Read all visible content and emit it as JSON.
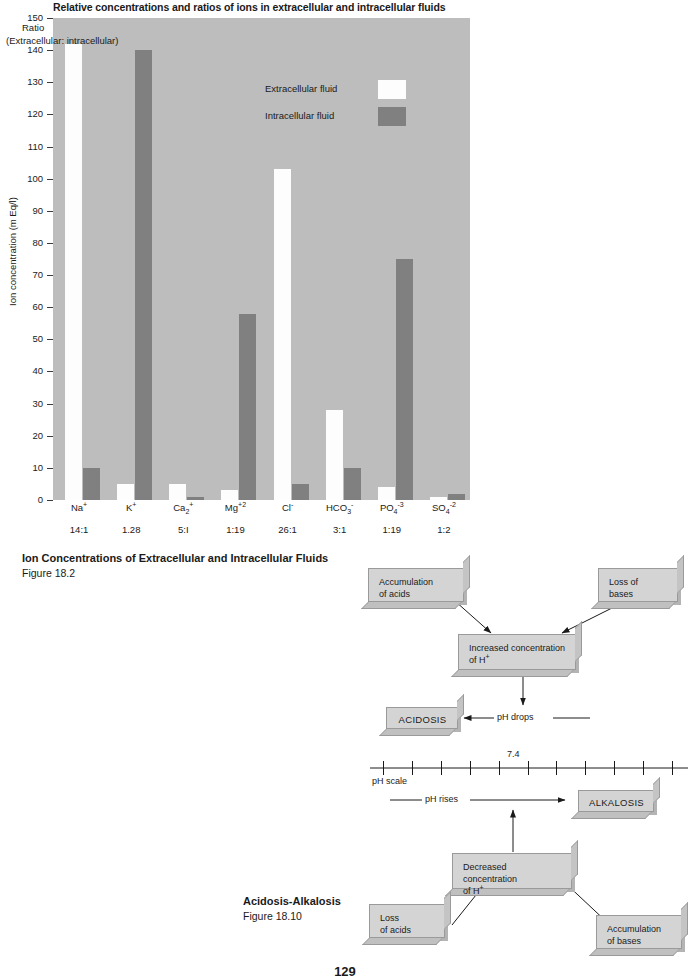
{
  "page": {
    "number": "129"
  },
  "chart_figure": {
    "title": "Relative concentrations and ratios of ions in extracellular and intracellular fluids",
    "caption_title": "Ion Concentrations of Extracellular and Intracellular Fluids",
    "caption_figure": "Figure 18.2",
    "ratio_label": "Ratio",
    "ratio_sublabel": "(Extracellular: intracellular)"
  },
  "chart_data": {
    "type": "bar",
    "title": "Relative concentrations and ratios of ions in extracellular and intracellular fluids",
    "xlabel": "",
    "ylabel": "Ion concentration (m Eq/l)",
    "ylim": [
      0,
      150
    ],
    "ytick_step": 10,
    "yticks": [
      0,
      10,
      20,
      30,
      40,
      50,
      60,
      70,
      80,
      90,
      100,
      110,
      120,
      130,
      140,
      150
    ],
    "grid": false,
    "legend_position": "inside-top-center",
    "categories": [
      "Na+",
      "K+",
      "Ca+2",
      "Mg+2",
      "Cl-",
      "HCO3-",
      "PO4-3",
      "SO4-2"
    ],
    "category_labels_html": [
      {
        "base": "Na",
        "sup": "+",
        "sub": ""
      },
      {
        "base": "K",
        "sup": "+",
        "sub": ""
      },
      {
        "base": "Ca",
        "sup": "+",
        "sub": "2"
      },
      {
        "base": "Mg",
        "sup": "+2",
        "sub": ""
      },
      {
        "base": "Cl",
        "sup": "-",
        "sub": ""
      },
      {
        "base": "HCO",
        "sup": "-",
        "sub": "3"
      },
      {
        "base": "PO",
        "sup": "-3",
        "sub": "4"
      },
      {
        "base": "SO",
        "sup": "-2",
        "sub": "4"
      }
    ],
    "ratios": [
      "14:1",
      "1.28",
      "5:I",
      "1:19",
      "26:1",
      "3:1",
      "1:19",
      "1:2"
    ],
    "series": [
      {
        "name": "Extracellular fluid",
        "color": "#fdfdfd",
        "values": [
          142,
          5,
          5,
          3,
          103,
          28,
          4,
          1
        ]
      },
      {
        "name": "Intracellular fluid",
        "color": "#808080",
        "values": [
          10,
          140,
          1,
          58,
          5,
          10,
          75,
          2
        ]
      }
    ],
    "plot_background": "#bdbdbd"
  },
  "flow_figure": {
    "caption_title": "Acidosis-Alkalosis",
    "caption_figure": "Figure 18.10",
    "boxes": [
      {
        "id": "accumulation-of-acids",
        "line1": "Accumulation",
        "line2": "of acids"
      },
      {
        "id": "loss-of-bases",
        "line1": "Loss of",
        "line2": "bases"
      },
      {
        "id": "increased-concentration",
        "line1": "Increased concentration",
        "line2": "of H+"
      },
      {
        "id": "acidosis",
        "line1": "ACIDOSIS",
        "line2": ""
      },
      {
        "id": "alkalosis",
        "line1": "ALKALOSIS",
        "line2": ""
      },
      {
        "id": "decreased-concentration",
        "line1": "Decreased concentration",
        "line2": "of H+"
      },
      {
        "id": "loss-of-acids",
        "line1": "Loss",
        "line2": "of acids"
      },
      {
        "id": "accumulation-of-bases",
        "line1": "Accumulation",
        "line2": "of bases"
      }
    ],
    "labels": {
      "ph_drops": "pH drops",
      "ph_rises": "pH rises",
      "ph_scale": "pH scale",
      "ph_value": "7.4"
    },
    "ph_scale_ticks": 11
  }
}
